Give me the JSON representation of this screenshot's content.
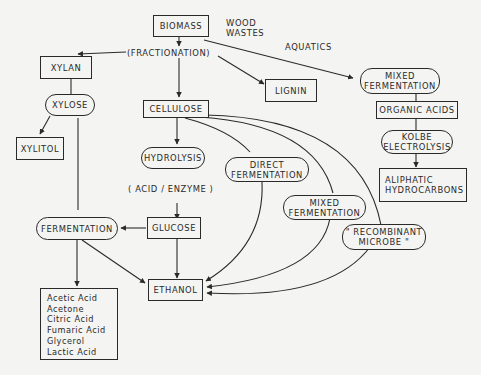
{
  "diagram": {
    "type": "flowchart",
    "nodes": {
      "biomass": "BIOMASS",
      "fractionation": "(FRACTIONATION)",
      "wood_wastes": "WOOD\nWASTES",
      "aquatics": "AQUATICS",
      "xylan": "XYLAN",
      "xylose": "XYLOSE",
      "xylitol": "XYLITOL",
      "cellulose": "CELLULOSE",
      "lignin": "LIGNIN",
      "mixed_fermentation_top": "MIXED\nFERMENTATION",
      "organic_acids": "ORGANIC ACIDS",
      "kolbe_electrolysis": "KOLBE\nELECTROLYSIS",
      "aliphatic_hydrocarbons": "ALIPHATIC\nHYDROCARBONS",
      "hydrolysis": "HYDROLYSIS",
      "acid_enzyme": "( ACID / ENZYME )",
      "direct_fermentation": "DIRECT\nFERMENTATION",
      "mixed_fermentation_mid": "MIXED\nFERMENTATION",
      "recombinant_microbe": "\" RECOMBINANT\nMICROBE \"",
      "glucose": "GLUCOSE",
      "fermentation": "FERMENTATION",
      "ethanol": "ETHANOL"
    },
    "products": [
      "Acetic Acid",
      "Acetone",
      "Citric Acid",
      "Fumaric Acid",
      "Glycerol",
      "Lactic Acid"
    ],
    "edges": [
      {
        "from": "biomass",
        "to": "fractionation"
      },
      {
        "from": "fractionation",
        "to": "xylan"
      },
      {
        "from": "fractionation",
        "to": "cellulose"
      },
      {
        "from": "fractionation",
        "to": "lignin"
      },
      {
        "from": "biomass",
        "to": "mixed_fermentation_top"
      },
      {
        "from": "xylan",
        "to": "xylose"
      },
      {
        "from": "xylose",
        "to": "xylitol"
      },
      {
        "from": "xylose",
        "to": "fermentation"
      },
      {
        "from": "mixed_fermentation_top",
        "to": "organic_acids"
      },
      {
        "from": "organic_acids",
        "to": "kolbe_electrolysis"
      },
      {
        "from": "kolbe_electrolysis",
        "to": "aliphatic_hydrocarbons"
      },
      {
        "from": "cellulose",
        "to": "hydrolysis"
      },
      {
        "from": "hydrolysis",
        "to": "glucose"
      },
      {
        "from": "cellulose",
        "to": "direct_fermentation"
      },
      {
        "from": "cellulose",
        "to": "mixed_fermentation_mid"
      },
      {
        "from": "cellulose",
        "to": "recombinant_microbe"
      },
      {
        "from": "glucose",
        "to": "fermentation"
      },
      {
        "from": "glucose",
        "to": "ethanol"
      },
      {
        "from": "fermentation",
        "to": "ethanol"
      },
      {
        "from": "fermentation",
        "to": "products"
      },
      {
        "from": "direct_fermentation",
        "to": "ethanol"
      },
      {
        "from": "mixed_fermentation_mid",
        "to": "ethanol"
      },
      {
        "from": "recombinant_microbe",
        "to": "ethanol"
      }
    ]
  },
  "colors": {
    "ink": "#2a2a2a",
    "paper": "#f4f4f2"
  }
}
